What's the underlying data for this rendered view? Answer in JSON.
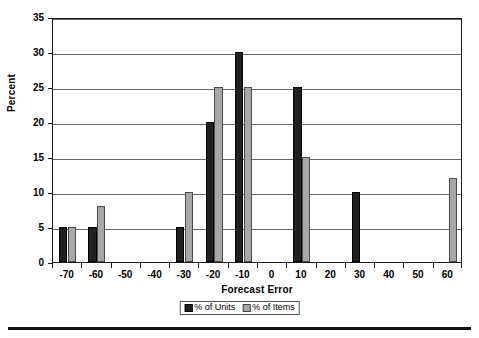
{
  "chart_data": {
    "type": "bar",
    "title": "",
    "xlabel": "Forecast Error",
    "ylabel": "Percent",
    "categories": [
      "-70",
      "-60",
      "-50",
      "-40",
      "-30",
      "-20",
      "-10",
      "0",
      "10",
      "20",
      "30",
      "40",
      "50",
      "60"
    ],
    "series": [
      {
        "name": "% of Units",
        "color": "#231f20",
        "values": [
          5,
          5,
          0,
          0,
          5,
          20,
          30,
          0,
          25,
          0,
          10,
          0,
          0,
          0
        ]
      },
      {
        "name": "% of Items",
        "color": "#a7a7a7",
        "values": [
          5,
          8,
          0,
          0,
          10,
          25,
          25,
          0,
          15,
          0,
          0,
          0,
          0,
          12
        ]
      }
    ],
    "ylim": [
      0,
      35
    ],
    "yticks": [
      0,
      5,
      10,
      15,
      20,
      25,
      30,
      35
    ],
    "ytick_labels": [
      "0",
      "5",
      "10",
      "15",
      "20",
      "25",
      "30",
      "35"
    ],
    "grid": true,
    "legend_position": "bottom-center"
  },
  "legend": {
    "entries": [
      {
        "label": "% of Units"
      },
      {
        "label": "% of Items"
      }
    ]
  }
}
